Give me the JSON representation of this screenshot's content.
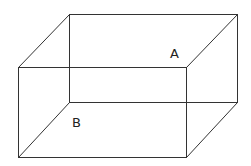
{
  "figure": {
    "type": "rectangular-prism-wireframe",
    "labels": {
      "A": "A",
      "B": "B"
    },
    "vertices": {
      "back_top_left": [
        69,
        14
      ],
      "back_top_right": [
        237,
        14
      ],
      "back_bottom_left": [
        70,
        102
      ],
      "back_bottom_right": [
        237,
        102
      ],
      "front_top_left": [
        18,
        67
      ],
      "front_top_right": [
        186,
        67
      ],
      "front_bottom_left": [
        18,
        157
      ],
      "front_bottom_right": [
        186,
        157
      ]
    },
    "line_color": "#333333"
  }
}
